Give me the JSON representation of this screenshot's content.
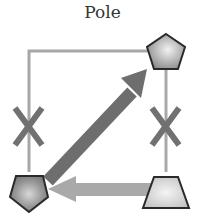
{
  "title": "Pole",
  "nodes": [
    {
      "id": "top-right",
      "shape": "pentagon",
      "position": "top-right"
    },
    {
      "id": "bottom-left",
      "shape": "pentagon",
      "position": "bottom-left"
    },
    {
      "id": "bottom-right",
      "shape": "trapezoid",
      "position": "bottom-right"
    }
  ],
  "edges": [
    {
      "from": "top-left-corner",
      "to": "top-right",
      "style": "thin-line"
    },
    {
      "from": "top-left-corner",
      "to": "bottom-left",
      "style": "thin-line",
      "blocked": true,
      "marker": "X"
    },
    {
      "from": "top-right",
      "to": "bottom-right",
      "style": "thin-line",
      "blocked": true,
      "marker": "X"
    },
    {
      "from": "bottom-left",
      "to": "top-right",
      "style": "thick-arrow",
      "color": "#6e6e6e"
    },
    {
      "from": "bottom-right",
      "to": "bottom-left",
      "style": "thick-arrow",
      "color": "#aaaaaa"
    }
  ],
  "colors": {
    "line": "#a8a8a8",
    "x_marker": "#707070",
    "diag_arrow": "#6e6e6e",
    "horiz_arrow": "#a9a9a9",
    "shape_stroke": "#2a2a2a"
  }
}
